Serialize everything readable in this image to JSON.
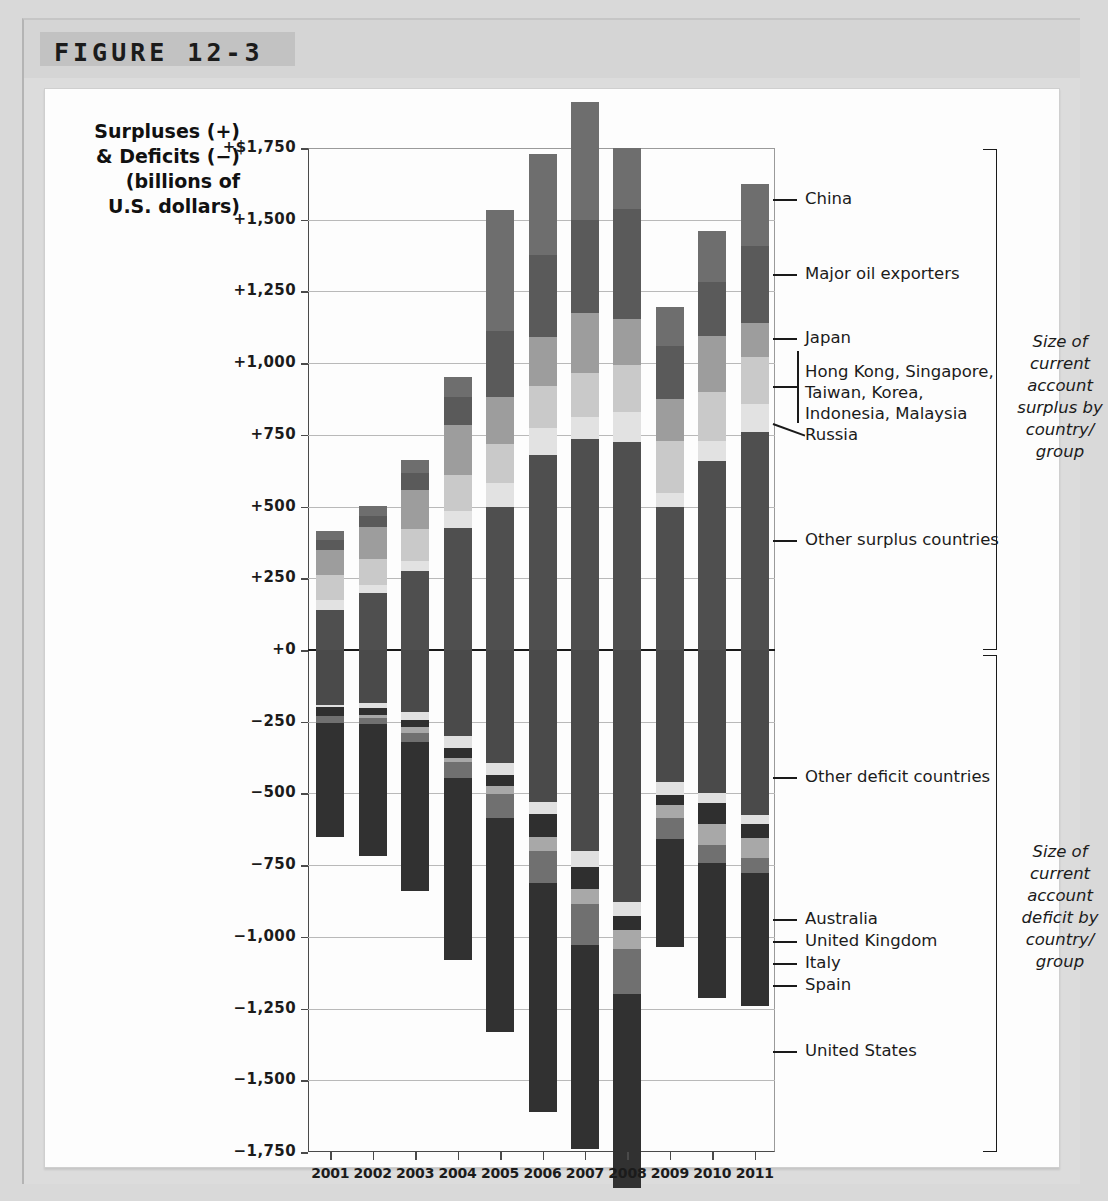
{
  "figure": {
    "label": "FIGURE 12-3"
  },
  "axis_title": "Surpluses (+)\n& Deficits (−)\n(billions of\nU.S. dollars)",
  "axis_title_lines": [
    "Surpluses (+)",
    "& Deficits (−)",
    "(billions of",
    "U.S. dollars)"
  ],
  "side_notes": {
    "surplus": "Size of current account surplus by country/ group",
    "surplus_lines": [
      "Size of",
      "current",
      "account",
      "surplus by",
      "country/",
      "group"
    ],
    "deficit": "Size of current account deficit by country/ group",
    "deficit_lines": [
      "Size of",
      "current",
      "account",
      "deficit by",
      "country/",
      "group"
    ]
  },
  "legend": {
    "surplus": [
      "China",
      "Major oil exporters",
      "Japan",
      "Hong Kong, Singapore,",
      "Taiwan, Korea,",
      "Indonesia, Malaysia",
      "Russia",
      "Other surplus countries"
    ],
    "asia_group_lines": [
      "Hong Kong, Singapore,",
      "Taiwan, Korea,",
      "Indonesia, Malaysia"
    ],
    "deficit": [
      "Other deficit countries",
      "Australia",
      "United Kingdom",
      "Italy",
      "Spain",
      "United States"
    ]
  },
  "colors": {
    "china": "#6e6e6e",
    "oil": "#5a5a5a",
    "japan": "#9d9d9d",
    "asia": "#c9c9c9",
    "russia": "#e2e2e2",
    "other_surplus": "#4f4f4f",
    "other_deficit": "#4a4a4a",
    "australia": "#e0e0e0",
    "united_kingdom": "#2f2f2f",
    "italy": "#a8a8a8",
    "spain": "#707070",
    "united_states": "#313131",
    "grid": "#b9b9b9",
    "axis": "#4a4a4a",
    "zero": "#1a1a1a",
    "plate": "#fdfdfd",
    "card": "#dcdcdc",
    "page": "#d9d9d9"
  },
  "chart_data": {
    "type": "bar",
    "subtype": "stacked-diverging",
    "title": "FIGURE 12-3",
    "xlabel": "",
    "ylabel": "Surpluses (+) & Deficits (−) (billions of U.S. dollars)",
    "ylim": [
      -1750,
      1750
    ],
    "ytick_values": [
      1750,
      1500,
      1250,
      1000,
      750,
      500,
      250,
      0,
      -250,
      -500,
      -750,
      -1000,
      -1250,
      -1500,
      -1750
    ],
    "ytick_labels": [
      "+$1,750",
      "+1,500",
      "+1,250",
      "+1,000",
      "+750",
      "+500",
      "+250",
      "+0",
      "−250",
      "−500",
      "−750",
      "−1,000",
      "−1,250",
      "−1,500",
      "−1,750"
    ],
    "grid": true,
    "legend_position": "right-callouts",
    "categories": [
      "2001",
      "2002",
      "2003",
      "2004",
      "2005",
      "2006",
      "2007",
      "2008",
      "2009",
      "2010",
      "2011"
    ],
    "series": [
      {
        "name": "Other surplus countries",
        "color": "#4f4f4f",
        "side": "surplus",
        "values": [
          140,
          197,
          275,
          425,
          497,
          680,
          735,
          725,
          498,
          658,
          760
        ]
      },
      {
        "name": "Russia",
        "color": "#e2e2e2",
        "side": "surplus",
        "values": [
          35,
          30,
          35,
          58,
          84,
          94,
          78,
          103,
          49,
          70,
          98
        ]
      },
      {
        "name": "Hong Kong, Singapore, Taiwan, Korea, Indonesia, Malaysia",
        "color": "#c9c9c9",
        "side": "surplus",
        "values": [
          85,
          90,
          112,
          128,
          136,
          147,
          152,
          165,
          180,
          170,
          163
        ]
      },
      {
        "name": "Japan",
        "color": "#9d9d9d",
        "side": "surplus",
        "values": [
          88,
          112,
          136,
          172,
          166,
          171,
          211,
          160,
          147,
          196,
          119
        ]
      },
      {
        "name": "Major oil exporters",
        "color": "#5a5a5a",
        "side": "surplus",
        "values": [
          35,
          38,
          60,
          100,
          230,
          285,
          322,
          385,
          185,
          190,
          270
        ]
      },
      {
        "name": "China",
        "color": "#6e6e6e",
        "side": "surplus",
        "values": [
          32,
          35,
          45,
          69,
          421,
          353,
          412,
          212,
          135,
          175,
          215
        ]
      },
      {
        "name": "Other deficit countries",
        "color": "#4a4a4a",
        "side": "deficit",
        "values": [
          -190,
          -185,
          -215,
          -300,
          -395,
          -530,
          -700,
          -880,
          -460,
          -500,
          -575
        ]
      },
      {
        "name": "Australia",
        "color": "#e0e0e0",
        "side": "deficit",
        "values": [
          -9,
          -16,
          -29,
          -40,
          -41,
          -41,
          -58,
          -47,
          -44,
          -33,
          -33
        ]
      },
      {
        "name": "United Kingdom",
        "color": "#2f2f2f",
        "side": "deficit",
        "values": [
          -31,
          -25,
          -24,
          -35,
          -38,
          -81,
          -75,
          -50,
          -38,
          -74,
          -46
        ]
      },
      {
        "name": "Italy",
        "color": "#a8a8a8",
        "side": "deficit",
        "values": [
          -1,
          -10,
          -20,
          -16,
          -29,
          -48,
          -51,
          -67,
          -43,
          -72,
          -70
        ]
      },
      {
        "name": "Spain",
        "color": "#707070",
        "side": "deficit",
        "values": [
          -24,
          -23,
          -31,
          -55,
          -83,
          -111,
          -144,
          -154,
          -75,
          -64,
          -52
        ]
      },
      {
        "name": "United States",
        "color": "#313131",
        "side": "deficit",
        "values": [
          -398,
          -459,
          -521,
          -634,
          -745,
          -800,
          -710,
          -677,
          -377,
          -470,
          -466
        ]
      }
    ],
    "totals": {
      "surplus": [
        415,
        502,
        663,
        952,
        1534,
        1730,
        1910,
        1750,
        1194,
        1459,
        1625
      ],
      "deficit": [
        -653,
        -718,
        -840,
        -1080,
        -1331,
        -1611,
        -1738,
        -1875,
        -1037,
        -1213,
        -1242
      ]
    }
  },
  "years": [
    "2001",
    "2002",
    "2003",
    "2004",
    "2005",
    "2006",
    "2007",
    "2008",
    "2009",
    "2010",
    "2011"
  ]
}
